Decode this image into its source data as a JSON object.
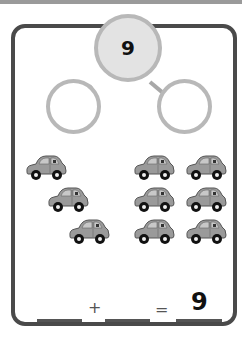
{
  "number_bond": {
    "whole": "9",
    "part_left": "",
    "part_right": ""
  },
  "cars": {
    "icon": "car-icon",
    "left_group_count": 3,
    "right_group_count": 6,
    "total": 9,
    "body_color": "#9a9a9a"
  },
  "equation": {
    "addend1": "",
    "plus": "+",
    "addend2": "",
    "equals": "=",
    "sum": "9"
  }
}
